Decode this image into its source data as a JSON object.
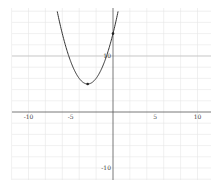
{
  "chart_data": {
    "type": "line",
    "title": "",
    "xlabel": "",
    "ylabel": "",
    "function": "y = (x + 3)^2 + 5",
    "series": [
      {
        "name": "parabola",
        "color": "#333333",
        "x": [
          -6.5,
          -6,
          -5,
          -4,
          -3,
          -2,
          -1,
          0,
          0.5
        ],
        "values": [
          17.25,
          14,
          9,
          6,
          5,
          6,
          9,
          14,
          17.25
        ]
      }
    ],
    "points": [
      {
        "label": "vertex",
        "x": -3,
        "y": 5
      },
      {
        "label": "y-intercept",
        "x": 0,
        "y": 14
      }
    ],
    "xlim": [
      -11,
      12
    ],
    "ylim": [
      -12,
      20
    ],
    "x_ticks": [
      -10,
      -5,
      5,
      10
    ],
    "y_ticks": [
      10,
      -10
    ],
    "x_tick_labels": [
      "-10",
      "-5",
      "5",
      "10"
    ],
    "y_tick_labels": [
      "10",
      "-10"
    ],
    "grid": true,
    "legend": "none"
  },
  "colors": {
    "axis": "#555555",
    "grid": "#e6e6e6",
    "curve": "#333333"
  }
}
